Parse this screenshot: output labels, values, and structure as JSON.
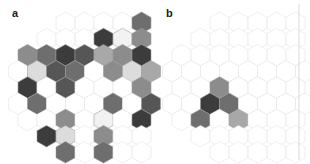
{
  "figure": {
    "background": "#ffffff",
    "divider_color": "#c8c8c8",
    "empty_cell_color": "#ffffff",
    "empty_cell_stroke": "#e2e2e2",
    "filled_cell_stroke": "#9a9a9a"
  },
  "palette": {
    "white": "#ffffff",
    "near_white": "#f2f2f2",
    "light": "#dcdcdc",
    "light_mid": "#c4c4c4",
    "mid": "#a8a8a8",
    "mid_dark": "#8c8c8c",
    "dark": "#6e6e6e",
    "darker": "#565656",
    "very_dark": "#3c3c3c",
    "near_black": "#2a2a2a"
  },
  "panels": [
    {
      "id": "a",
      "label": "a",
      "label_x": 12,
      "label_y": 17,
      "origin_x": 18,
      "origin_y": 12,
      "hex_width": 19.0,
      "hex_height": 21.5,
      "row_step": 16.2,
      "rows": [
        {
          "count": 5,
          "offset": 2.0,
          "fills": [
            "white",
            "white",
            "white",
            "white",
            "dark"
          ]
        },
        {
          "count": 6,
          "offset": 1.0,
          "fills": [
            "white",
            "white",
            "white",
            "very_dark",
            "near_white",
            "mid_dark"
          ]
        },
        {
          "count": 7,
          "offset": 0.0,
          "fills": [
            "mid_dark",
            "dark",
            "very_dark",
            "darker",
            "mid",
            "mid_dark",
            "very_dark"
          ]
        },
        {
          "count": 8,
          "offset": -0.5,
          "fills": [
            "white",
            "light",
            "darker",
            "dark",
            "white",
            "mid_dark",
            "light",
            "mid"
          ]
        },
        {
          "count": 7,
          "offset": 0.0,
          "fills": [
            "very_dark",
            "white",
            "darker",
            "white",
            "white",
            "white",
            "mid_dark"
          ]
        },
        {
          "count": 8,
          "offset": -0.5,
          "fills": [
            "white",
            "dark",
            "white",
            "white",
            "white",
            "dark",
            "white",
            "darker"
          ]
        },
        {
          "count": 7,
          "offset": 0.0,
          "fills": [
            "white",
            "white",
            "mid_dark",
            "white",
            "near_white",
            "white",
            "very_dark"
          ]
        },
        {
          "count": 6,
          "offset": 1.0,
          "fills": [
            "very_dark",
            "light",
            "white",
            "mid_dark",
            "white",
            "white"
          ]
        },
        {
          "count": 5,
          "offset": 2.0,
          "fills": [
            "dark",
            "white",
            "dark",
            "white",
            "white"
          ]
        }
      ]
    },
    {
      "id": "b",
      "label": "b",
      "label_x": 166,
      "label_y": 17,
      "origin_x": 172,
      "origin_y": 12,
      "hex_width": 19.0,
      "hex_height": 21.5,
      "row_step": 16.2,
      "rows": [
        {
          "count": 5,
          "offset": 2.0,
          "fills": [
            "white",
            "white",
            "white",
            "white",
            "white"
          ]
        },
        {
          "count": 6,
          "offset": 1.0,
          "fills": [
            "white",
            "white",
            "white",
            "white",
            "white",
            "white"
          ]
        },
        {
          "count": 7,
          "offset": 0.0,
          "fills": [
            "white",
            "white",
            "white",
            "white",
            "white",
            "white",
            "white"
          ]
        },
        {
          "count": 8,
          "offset": -0.5,
          "fills": [
            "white",
            "white",
            "white",
            "white",
            "white",
            "white",
            "white",
            "white"
          ]
        },
        {
          "count": 7,
          "offset": 0.0,
          "fills": [
            "white",
            "white",
            "mid_dark",
            "white",
            "white",
            "white",
            "white"
          ]
        },
        {
          "count": 8,
          "offset": -0.5,
          "fills": [
            "white",
            "white",
            "very_dark",
            "dark",
            "white",
            "white",
            "white",
            "white"
          ]
        },
        {
          "count": 7,
          "offset": 0.0,
          "fills": [
            "white",
            "dark",
            "white",
            "mid",
            "white",
            "white",
            "white"
          ]
        },
        {
          "count": 6,
          "offset": 1.0,
          "fills": [
            "white",
            "white",
            "white",
            "white",
            "white",
            "white"
          ]
        },
        {
          "count": 5,
          "offset": 2.0,
          "fills": [
            "white",
            "white",
            "white",
            "white",
            "white"
          ]
        }
      ]
    }
  ],
  "divider": {
    "x": 299,
    "y1": 4,
    "y2": 160
  }
}
